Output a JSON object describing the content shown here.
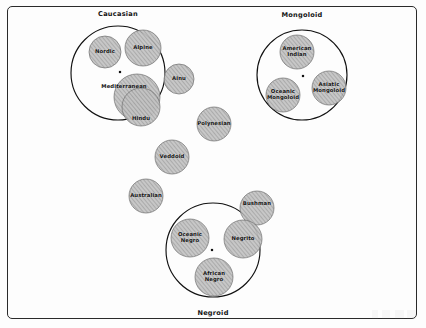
{
  "figure": {
    "background_color": "#fdfdfd",
    "frame_color": "#2a2a2a",
    "circle_fill": "#b8b8b8",
    "circle_stroke": "#6f6f6f",
    "group_stroke": "#111111"
  },
  "groups": [
    {
      "name": "caucasian",
      "label": "Caucasian",
      "cx": 118,
      "cy": 73,
      "r": 47,
      "label_x": 118,
      "label_y": 10,
      "center_dot": {
        "x": 120,
        "y": 72
      }
    },
    {
      "name": "mongoloid",
      "label": "Mongoloid",
      "cx": 302,
      "cy": 75,
      "r": 45,
      "label_x": 302,
      "label_y": 11,
      "center_dot": {
        "x": 303,
        "y": 76
      }
    },
    {
      "name": "negroid",
      "label": "Negroid",
      "cx": 213,
      "cy": 250,
      "r": 47,
      "label_x": 213,
      "label_y": 309,
      "center_dot": {
        "x": 212,
        "y": 250
      }
    }
  ],
  "populations": [
    {
      "name": "nordic",
      "label": "Nordic",
      "lines": [
        "Nordic"
      ],
      "cx": 105,
      "cy": 52,
      "r": 16
    },
    {
      "name": "alpine",
      "label": "Alpine",
      "lines": [
        "Alpine"
      ],
      "cx": 143,
      "cy": 48,
      "r": 18
    },
    {
      "name": "mediterranean",
      "label": "Mediterranean",
      "lines": [
        "Mediterranean"
      ],
      "cx": 137,
      "cy": 97,
      "r": 23,
      "label_x": 124,
      "label_y": 87
    },
    {
      "name": "ainu",
      "label": "Ainu",
      "lines": [
        "Ainu"
      ],
      "cx": 179,
      "cy": 79,
      "r": 15
    },
    {
      "name": "hindu",
      "label": "Hindu",
      "lines": [
        "Hindu"
      ],
      "cx": 141,
      "cy": 107,
      "r": 19,
      "label_x": 141,
      "label_y": 119
    },
    {
      "name": "polynesian",
      "label": "Polynesian",
      "lines": [
        "Polynesian"
      ],
      "cx": 214,
      "cy": 124,
      "r": 17
    },
    {
      "name": "veddoid",
      "label": "Veddoid",
      "lines": [
        "Veddoid"
      ],
      "cx": 172,
      "cy": 157,
      "r": 17
    },
    {
      "name": "australian",
      "label": "Australian",
      "lines": [
        "Australian"
      ],
      "cx": 146,
      "cy": 196,
      "r": 17
    },
    {
      "name": "american-indian",
      "label": "American Indian",
      "lines": [
        "American",
        "Indian"
      ],
      "cx": 297,
      "cy": 52,
      "r": 17
    },
    {
      "name": "oceanic-mongoloid",
      "label": "Oceanic Mongoloid",
      "lines": [
        "Oceanic",
        "Mongoloid"
      ],
      "cx": 283,
      "cy": 95,
      "r": 17
    },
    {
      "name": "asiatic-mongoloid",
      "label": "Asiatic Mongoloid",
      "lines": [
        "Asiatic",
        "Mongoloid"
      ],
      "cx": 329,
      "cy": 88,
      "r": 17
    },
    {
      "name": "bushman",
      "label": "Bushman",
      "lines": [
        "Bushman"
      ],
      "cx": 257,
      "cy": 208,
      "r": 17,
      "label_x": 257,
      "label_y": 204
    },
    {
      "name": "oceanic-negro",
      "label": "Oceanic Negro",
      "lines": [
        "Oceanic",
        "Negro"
      ],
      "cx": 190,
      "cy": 238,
      "r": 19
    },
    {
      "name": "negrito",
      "label": "Negrito",
      "lines": [
        "Negrito"
      ],
      "cx": 243,
      "cy": 239,
      "r": 19
    },
    {
      "name": "african-negro",
      "label": "African Negro",
      "lines": [
        "African",
        "Negro"
      ],
      "cx": 214,
      "cy": 277,
      "r": 19
    }
  ]
}
